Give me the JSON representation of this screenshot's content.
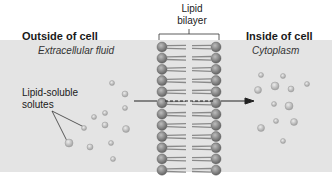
{
  "diagram": {
    "labels": {
      "outside_title": "Outside of cell",
      "outside_sub": "Extracellular fluid",
      "inside_title": "Inside of cell",
      "inside_sub": "Cytoplasm",
      "bilayer_line1": "Lipid",
      "bilayer_line2": "bilayer",
      "solutes_line1": "Lipid-soluble",
      "solutes_line2": "solutes"
    },
    "colors": {
      "band": "#e4e4e4",
      "head": "#7a7a7a",
      "tail": "#8a8a8a",
      "solute": "#b8b8b8",
      "arrow": "#222222"
    }
  }
}
